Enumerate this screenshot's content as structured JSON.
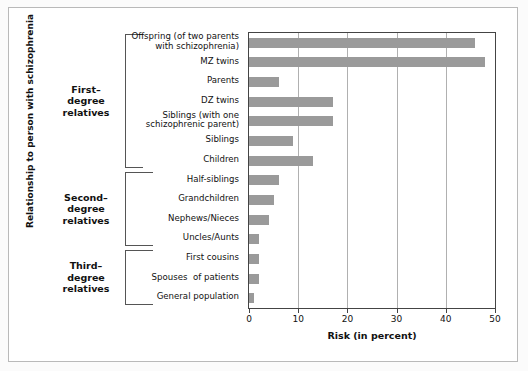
{
  "chart_data": {
    "type": "bar",
    "orientation": "horizontal",
    "title": "",
    "xlabel": "Risk (in percent)",
    "ylabel": "Relationship to person with schizophrenia",
    "xlim": [
      0,
      50
    ],
    "xticks": [
      0,
      10,
      20,
      30,
      40,
      50
    ],
    "xtick_labels": [
      "0",
      "10",
      "20",
      "30",
      "40",
      "50"
    ],
    "grid": "vertical",
    "legend": "none",
    "bar_color": "#9a9a9a",
    "categories": [
      "Offspring (of two parents\nwith schizophrenia)",
      "MZ twins",
      "Parents",
      "DZ twins",
      "Siblings (with one\nschizophrenic parent)",
      "Siblings",
      "Children",
      "Half-siblings",
      "Grandchildren",
      "Nephews/Nieces",
      "Uncles/Aunts",
      "First cousins",
      "Spouses  of patients",
      "General population"
    ],
    "values": [
      46,
      48,
      6,
      17,
      17,
      9,
      13,
      6,
      5,
      4,
      2,
      2,
      2,
      1
    ]
  },
  "groups": [
    {
      "label": "First–\ndegree\nrelatives",
      "start": 0,
      "end": 6
    },
    {
      "label": "Second–\ndegree\nrelatives",
      "start": 7,
      "end": 10
    },
    {
      "label": "Third–\ndegree\nrelatives",
      "start": 11,
      "end": 13
    }
  ]
}
